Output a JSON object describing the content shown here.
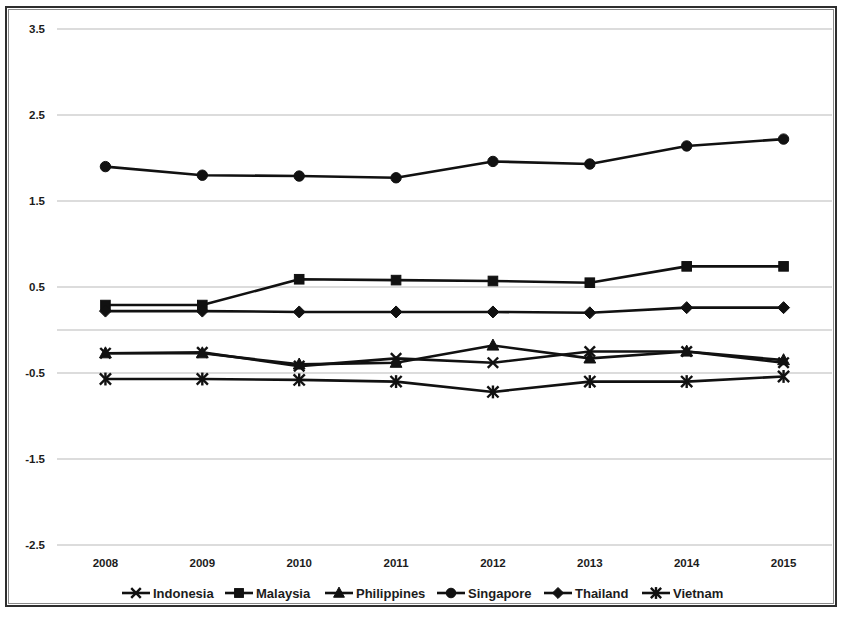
{
  "chart_data": {
    "type": "line",
    "title": "",
    "subtitle": "",
    "xlabel": "",
    "ylabel": "",
    "x": [
      "2008",
      "2009",
      "2010",
      "2011",
      "2012",
      "2013",
      "2014",
      "2015"
    ],
    "categories": [
      "2008",
      "2009",
      "2010",
      "2011",
      "2012",
      "2013",
      "2014",
      "2015"
    ],
    "xtick_labels": [
      "2008",
      "2009",
      "2010",
      "2011",
      "2012",
      "2013",
      "2014",
      "2015"
    ],
    "ytick_labels": [
      "3.5",
      "2.5",
      "1.5",
      "0.5",
      "-0.5",
      "-1.5",
      "-2.5"
    ],
    "ytick_values": [
      3.5,
      2.5,
      1.5,
      0.5,
      -0.5,
      -1.5,
      -2.5
    ],
    "gridline_values": [
      3.5,
      2.5,
      1.5,
      0.5,
      0,
      -0.5,
      -1.5,
      -2.5
    ],
    "ylim": [
      -2.5,
      3.5
    ],
    "grid": "horizontal",
    "legend_position": "bottom",
    "axis_color": "#b9b9b9",
    "series_color": "#111111",
    "series": [
      {
        "name": "Indonesia",
        "marker": "x",
        "values": [
          -0.27,
          -0.26,
          -0.42,
          -0.33,
          -0.38,
          -0.25,
          -0.25,
          -0.38
        ]
      },
      {
        "name": "Malaysia",
        "marker": "square",
        "values": [
          0.29,
          0.29,
          0.59,
          0.58,
          0.57,
          0.55,
          0.74,
          0.74
        ]
      },
      {
        "name": "Philippines",
        "marker": "triangle",
        "values": [
          -0.27,
          -0.27,
          -0.4,
          -0.38,
          -0.18,
          -0.33,
          -0.25,
          -0.35
        ]
      },
      {
        "name": "Singapore",
        "marker": "circle",
        "values": [
          1.9,
          1.8,
          1.79,
          1.77,
          1.96,
          1.93,
          2.14,
          2.22
        ]
      },
      {
        "name": "Thailand",
        "marker": "diamond",
        "values": [
          0.22,
          0.22,
          0.21,
          0.21,
          0.21,
          0.2,
          0.26,
          0.26
        ]
      },
      {
        "name": "Vietnam",
        "marker": "asterisk",
        "values": [
          -0.57,
          -0.57,
          -0.58,
          -0.6,
          -0.72,
          -0.6,
          -0.6,
          -0.54
        ]
      }
    ],
    "legend": [
      "Indonesia",
      "Malaysia",
      "Philippines",
      "Singapore",
      "Thailand",
      "Vietnam"
    ]
  }
}
